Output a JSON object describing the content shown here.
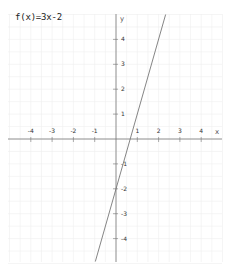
{
  "title": "f(x)=3x-2",
  "chart_data": {
    "type": "line",
    "title": "f(x)=3x-2",
    "function": "3x-2",
    "slope": 3,
    "intercept": -2,
    "xlabel": "x",
    "ylabel": "y",
    "xlim": [
      -5,
      5
    ],
    "ylim": [
      -5,
      5
    ],
    "x_ticks": [
      -4,
      -3,
      -2,
      -1,
      1,
      2,
      3,
      4
    ],
    "y_ticks": [
      4,
      3,
      2,
      1,
      -1,
      -2,
      -3,
      -4
    ],
    "grid": true,
    "series": [
      {
        "name": "f(x)=3x-2",
        "x": [
          -0.97,
          2.33
        ],
        "y": [
          -4.92,
          5.0
        ]
      }
    ]
  },
  "colors": {
    "axis": "#777777",
    "grid": "#eeeeee",
    "line": "#777777",
    "text": "#333333"
  }
}
